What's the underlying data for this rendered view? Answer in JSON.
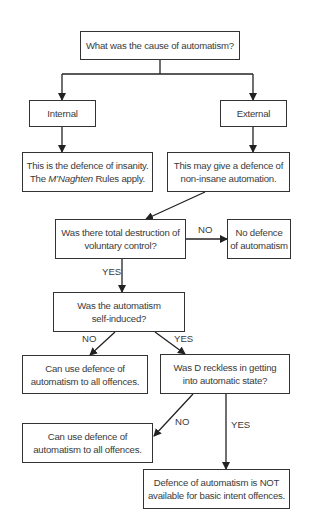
{
  "diagram": {
    "type": "flowchart",
    "nodes": {
      "q_cause": "What was the cause of automatism?",
      "internal": "Internal",
      "external": "External",
      "insanity": {
        "line1": "This is the defence of insanity.",
        "line2_pre": "The ",
        "line2_italic": "M’Naghten",
        "line2_post": " Rules apply."
      },
      "non_insane": {
        "line1": "This may give a defence of",
        "line2": "non-insane automation."
      },
      "q_total": {
        "line1": "Was there total destruction of",
        "line2": "voluntary control?"
      },
      "no_defence": {
        "line1": "No defence",
        "line2": "of automatism"
      },
      "q_self": {
        "line1": "Was the automatism",
        "line2": "self-induced?"
      },
      "can_use_1": {
        "line1": "Can use defence of",
        "line2": "automatism to all offences."
      },
      "q_reckless": {
        "line1": "Was D reckless in getting",
        "line2": "into automatic state?"
      },
      "can_use_2": {
        "line1": "Can use defence of",
        "line2": "automatism to all offences."
      },
      "not_available": {
        "line1": "Defence of automatism is NOT",
        "line2": "available for basic intent offences."
      }
    },
    "edge_labels": {
      "total_no": "NO",
      "total_yes": "YES",
      "self_no": "NO",
      "self_yes": "YES",
      "reckless_no": "NO",
      "reckless_yes": "YES"
    },
    "colors": {
      "line": "#222222",
      "text": "#3a3a3a",
      "background": "#ffffff"
    }
  }
}
